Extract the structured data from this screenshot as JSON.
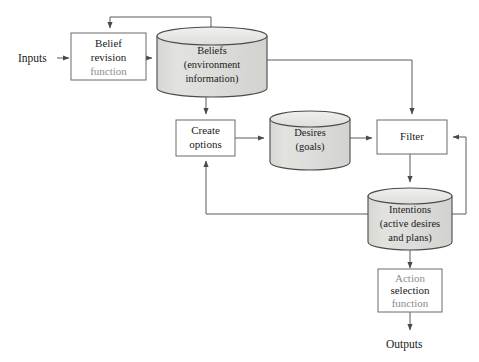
{
  "diagram": {
    "colors": {
      "store_fill": "#dddddb",
      "store_top_fill": "#e9e9e7",
      "store_stroke": "#4a4a4a",
      "box_fill": "#ffffff",
      "box_stroke": "#6b6b6b",
      "line": "#5a5a5a",
      "text_dark": "#1a1a1a",
      "text_muted": "#8d8d8d",
      "background": "#ffffff"
    },
    "io": {
      "input_label": "Inputs",
      "output_label": "Outputs"
    },
    "processes": [
      {
        "id": "belief-revision",
        "lines": [
          {
            "text": "Belief",
            "style": "dark"
          },
          {
            "text": "revision",
            "style": "dark"
          },
          {
            "text": "function",
            "style": "muted"
          }
        ]
      },
      {
        "id": "create-options",
        "lines": [
          {
            "text": "Create",
            "style": "dark"
          },
          {
            "text": "options",
            "style": "dark"
          }
        ]
      },
      {
        "id": "filter",
        "lines": [
          {
            "text": "Filter",
            "style": "dark"
          }
        ]
      },
      {
        "id": "action-selection",
        "lines": [
          {
            "text": "Action",
            "style": "muted"
          },
          {
            "text": "selection",
            "style": "dark"
          },
          {
            "text": "function",
            "style": "muted"
          }
        ]
      }
    ],
    "stores": [
      {
        "id": "beliefs",
        "lines": [
          {
            "text": "Beliefs"
          },
          {
            "text": "(environment"
          },
          {
            "text": "information)"
          }
        ]
      },
      {
        "id": "desires",
        "lines": [
          {
            "text": "Desires"
          },
          {
            "text": "(goals)"
          }
        ]
      },
      {
        "id": "intentions",
        "lines": [
          {
            "text": "Intentions"
          },
          {
            "text": "(active desires"
          },
          {
            "text": "and plans)"
          }
        ]
      }
    ]
  }
}
